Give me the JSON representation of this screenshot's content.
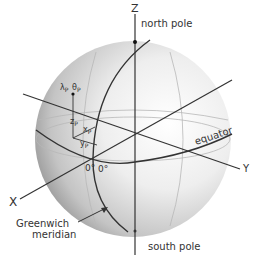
{
  "diagram": {
    "axes": {
      "z": "Z",
      "x": "X",
      "y": "Y"
    },
    "labels": {
      "north_pole": "north pole",
      "south_pole": "south pole",
      "equator": "equator",
      "greenwich_line1": "Greenwich",
      "greenwich_line2": "meridian",
      "zero_lat": "0°",
      "zero_lon": "0°"
    },
    "point": {
      "lambda": "λ",
      "lambda_sub": "P",
      "theta": "θ",
      "theta_sub": "P",
      "zp": "z",
      "zp_sub": "P",
      "xp": "x",
      "xp_sub": "P",
      "yp": "y",
      "yp_sub": "P"
    },
    "colors": {
      "sphere_light": "#ffffff",
      "sphere_dark": "#8a8a8a",
      "line": "#222222",
      "grid": "#b5b5b5"
    }
  }
}
